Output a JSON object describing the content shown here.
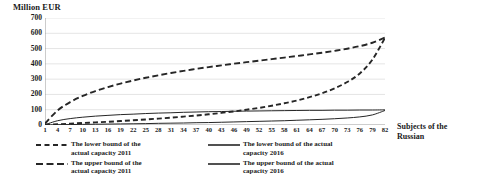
{
  "chart_data": {
    "type": "line",
    "title": "",
    "ylabel": "Million EUR",
    "xlabel": "Subjects of the Russian",
    "xlabel_line1": "Subjects of the",
    "xlabel_line2": "Russian",
    "ylim": [
      0,
      700
    ],
    "xlim": [
      1,
      82
    ],
    "grid": true,
    "legend_position": "bottom",
    "y_ticks": [
      700,
      600,
      500,
      400,
      300,
      200,
      100,
      0
    ],
    "x_ticks": [
      1,
      4,
      7,
      10,
      13,
      16,
      19,
      22,
      25,
      28,
      31,
      34,
      37,
      40,
      43,
      46,
      49,
      52,
      55,
      58,
      61,
      64,
      67,
      70,
      73,
      76,
      79,
      82
    ],
    "x": [
      1,
      4,
      7,
      10,
      13,
      16,
      19,
      22,
      25,
      28,
      31,
      34,
      37,
      40,
      43,
      46,
      49,
      52,
      55,
      58,
      61,
      64,
      67,
      70,
      73,
      76,
      79,
      82
    ],
    "series": [
      {
        "name": "The lower bound of the actual capacity 2011",
        "style": "dashed",
        "color": "#262626",
        "values": [
          2,
          5,
          9,
          13,
          17,
          21,
          26,
          31,
          36,
          42,
          48,
          55,
          62,
          70,
          79,
          89,
          100,
          112,
          126,
          142,
          160,
          182,
          208,
          240,
          281,
          337,
          428,
          570
        ]
      },
      {
        "name": "The upper bound of the actual capacity 2011",
        "style": "dashed",
        "color": "#262626",
        "values": [
          10,
          95,
          150,
          190,
          222,
          248,
          271,
          291,
          309,
          325,
          340,
          354,
          367,
          379,
          390,
          401,
          411,
          421,
          431,
          441,
          451,
          462,
          473,
          485,
          499,
          516,
          538,
          572
        ]
      },
      {
        "name": "The lower bound of the actual capacity 2016",
        "style": "solid",
        "color": "#262626",
        "values": [
          1,
          2,
          3,
          4,
          5,
          6,
          7,
          8,
          9,
          11,
          12,
          13,
          15,
          16,
          18,
          20,
          22,
          24,
          26,
          28,
          31,
          34,
          37,
          41,
          46,
          53,
          66,
          95
        ]
      },
      {
        "name": "The upper bound of the actual capacity 2016",
        "style": "solid",
        "color": "#262626",
        "values": [
          2,
          28,
          42,
          51,
          58,
          63,
          68,
          71,
          75,
          78,
          80,
          83,
          85,
          87,
          88,
          90,
          91,
          92,
          93,
          94,
          95,
          96,
          96,
          97,
          97,
          98,
          98,
          99
        ]
      }
    ]
  },
  "legend": {
    "entries": [
      {
        "label": "The lower bound of the\nactual capacity 2011",
        "style": "dashed-short",
        "column": "left"
      },
      {
        "label": "The upper bound of the\nactual capacity 2011",
        "style": "dashed-long",
        "column": "left"
      },
      {
        "label": "The lower bound of the actual\ncapacity 2016",
        "style": "solid",
        "column": "right"
      },
      {
        "label": "The upper bound of the actual\ncapacity 2016",
        "style": "solid",
        "column": "right"
      }
    ]
  },
  "colors": {
    "line": "#262626",
    "grid": "#d9d9d9",
    "text": "#1a1a1a",
    "background": "#ffffff"
  }
}
